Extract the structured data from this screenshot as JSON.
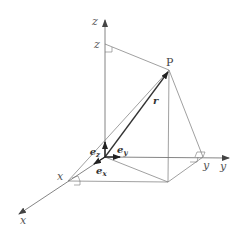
{
  "diagram": {
    "type": "3d-cartesian-position-vector",
    "colors": {
      "line": "#777777",
      "vector": "#333333",
      "background": "#ffffff"
    },
    "labels": {
      "z_axis": "z",
      "z_coord": "z",
      "y_axis": "y",
      "y_coord": "y",
      "x_axis": "x",
      "x_coord": "x",
      "point": "P",
      "position_vector": "r",
      "unit_x": "e",
      "unit_x_sub": "x",
      "unit_y": "e",
      "unit_y_sub": "y",
      "unit_z": "e",
      "unit_z_sub": "z"
    }
  }
}
